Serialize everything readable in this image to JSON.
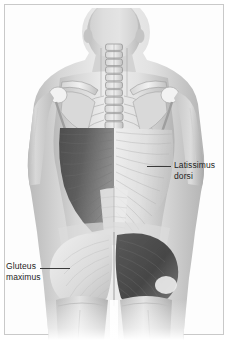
{
  "figure": {
    "view": "posterior",
    "background_color": "#ffffff",
    "frame_color": "#c9c9c9",
    "label_text_color": "#1d1d1d",
    "leader_line_color": "#3a3a3a",
    "highlight_shade_color": "#4a4a4a"
  },
  "labels": [
    {
      "id": "latissimus-dorsi",
      "text": "Latissimus\ndorsi",
      "line1": "Latissimus",
      "line2": "dorsi",
      "side": "right",
      "points_to": "latissimus-dorsi-muscle"
    },
    {
      "id": "gluteus-maximus",
      "text": "Gluteus\nmaximus",
      "line1": "Gluteus",
      "line2": "maximus",
      "side": "left",
      "points_to": "gluteus-maximus-muscle"
    }
  ],
  "anatomy": {
    "structures": [
      "head",
      "cervical-vertebrae",
      "thoracic-vertebrae",
      "lumbar-vertebrae",
      "scapula-left",
      "scapula-right",
      "clavicle-left",
      "clavicle-right",
      "humerus-left",
      "humerus-right",
      "ribs",
      "latissimus-dorsi-left",
      "latissimus-dorsi-right",
      "thoracolumbar-fascia",
      "gluteus-maximus-left",
      "gluteus-maximus-right",
      "pelvis",
      "thigh-left",
      "thigh-right"
    ],
    "shaded_structures": [
      "latissimus-dorsi-left",
      "gluteus-maximus-right"
    ]
  }
}
